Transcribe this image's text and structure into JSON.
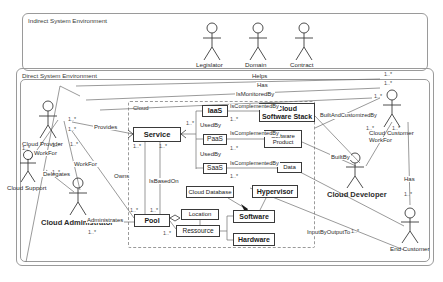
{
  "diagram": {
    "frames": [
      {
        "name": "indirect-system-environment",
        "label": "Indirect System Environment"
      },
      {
        "name": "direct-system-environment",
        "label": "Direct System Environment"
      },
      {
        "name": "cloud-boundary",
        "label": "Cloud"
      }
    ],
    "actors": [
      {
        "name": "legislator",
        "label": "Legislator",
        "x": 212,
        "y": 22,
        "bold": false
      },
      {
        "name": "domain",
        "label": "Domain",
        "x": 258,
        "y": 22,
        "bold": false
      },
      {
        "name": "contract",
        "label": "Contract",
        "x": 304,
        "y": 22,
        "bold": false
      },
      {
        "name": "cloud-provider",
        "label": "Cloud Provider",
        "x": 48,
        "y": 101,
        "bold": false
      },
      {
        "name": "cloud-support",
        "label": "Cloud Support",
        "x": 28,
        "y": 167,
        "bold": false
      },
      {
        "name": "cloud-administrator",
        "label": "Cloud Administrator",
        "x": 78,
        "y": 196,
        "bold": true
      },
      {
        "name": "cloud-customer",
        "label": "Cloud Customer",
        "x": 392,
        "y": 107,
        "bold": false
      },
      {
        "name": "cloud-developer",
        "label": "Cloud Developer",
        "x": 355,
        "y": 169,
        "bold": true
      },
      {
        "name": "end-customer",
        "label": "End Customer",
        "x": 410,
        "y": 228,
        "bold": false
      }
    ],
    "classes": [
      {
        "name": "service",
        "label": "Service",
        "x": 133,
        "y": 127,
        "w": 48,
        "h": 15,
        "bold": true,
        "size": 7.5
      },
      {
        "name": "iaas",
        "label": "IaaS",
        "x": 202,
        "y": 105,
        "w": 26,
        "h": 12,
        "bold": true,
        "size": 7
      },
      {
        "name": "paas",
        "label": "PaaS",
        "x": 203,
        "y": 134,
        "w": 24,
        "h": 11,
        "bold": false,
        "size": 6.5
      },
      {
        "name": "saas",
        "label": "SaaS",
        "x": 203,
        "y": 163,
        "w": 24,
        "h": 11,
        "bold": false,
        "size": 6.5
      },
      {
        "name": "cloud-software-stack",
        "label": "Cloud\nSoftware Stack",
        "x": 259,
        "y": 103,
        "w": 56,
        "h": 19,
        "bold": true,
        "size": 7
      },
      {
        "name": "software-product",
        "label": "Software\nProduct",
        "x": 264,
        "y": 130,
        "w": 38,
        "h": 18,
        "bold": false,
        "size": 6
      },
      {
        "name": "data",
        "label": "Data",
        "x": 277,
        "y": 162,
        "w": 25,
        "h": 11,
        "bold": false,
        "size": 6
      },
      {
        "name": "cloud-database",
        "label": "Cloud Database",
        "x": 186,
        "y": 186,
        "w": 48,
        "h": 12,
        "bold": false,
        "size": 6
      },
      {
        "name": "hypervisor",
        "label": "Hypervisor",
        "x": 252,
        "y": 185,
        "w": 46,
        "h": 13,
        "bold": true,
        "size": 7
      },
      {
        "name": "pool",
        "label": "Pool",
        "x": 134,
        "y": 214,
        "w": 36,
        "h": 13,
        "bold": true,
        "size": 7
      },
      {
        "name": "location",
        "label": "Location",
        "x": 181,
        "y": 209,
        "w": 38,
        "h": 11,
        "bold": false,
        "size": 6
      },
      {
        "name": "ressource",
        "label": "Ressource",
        "x": 176,
        "y": 225,
        "w": 44,
        "h": 12,
        "bold": false,
        "size": 6.5
      },
      {
        "name": "software",
        "label": "Software",
        "x": 233,
        "y": 210,
        "w": 42,
        "h": 13,
        "bold": true,
        "size": 7
      },
      {
        "name": "hardware",
        "label": "Hardware",
        "x": 233,
        "y": 233,
        "w": 42,
        "h": 13,
        "bold": true,
        "size": 7
      }
    ],
    "relations": [
      {
        "name": "rel-helps",
        "label": "Helps",
        "x": 251,
        "y": 73
      },
      {
        "name": "rel-has-top",
        "label": "Has",
        "x": 256,
        "y": 82
      },
      {
        "name": "rel-ismonitoredby",
        "label": "IsMonitoredBy",
        "x": 235,
        "y": 91
      },
      {
        "name": "rel-provides",
        "label": "Provides",
        "x": 93,
        "y": 128
      },
      {
        "name": "rel-owns",
        "label": "Owns",
        "x": 113,
        "y": 173
      },
      {
        "name": "rel-workfor-left-a",
        "label": "WorkFor",
        "x": 33,
        "y": 152
      },
      {
        "name": "rel-workfor-left-b",
        "label": "WorkFor",
        "x": 73,
        "y": 187
      },
      {
        "name": "rel-delegates",
        "label": "Delegates",
        "x": 42,
        "y": 176
      },
      {
        "name": "rel-administrates",
        "label": "Administrates",
        "x": 86,
        "y": 226
      },
      {
        "name": "rel-usedby-1",
        "label": "UsedBy",
        "x": 200,
        "y": 122
      },
      {
        "name": "rel-usedby-2",
        "label": "UsedBy",
        "x": 200,
        "y": 151
      },
      {
        "name": "rel-iscomplementedby-1",
        "label": "IsComplementedBy",
        "x": 229,
        "y": 104
      },
      {
        "name": "rel-iscomplementedby-2",
        "label": "IsComplementedBy",
        "x": 229,
        "y": 131
      },
      {
        "name": "rel-iscomplementedby-3",
        "label": "IsComplementedBy",
        "x": 229,
        "y": 162
      },
      {
        "name": "rel-isbasedon",
        "label": "IsBasedOn",
        "x": 148,
        "y": 178
      },
      {
        "name": "rel-buildandcustomizedby",
        "label": "BuiltAndCustomizedBy",
        "x": 321,
        "y": 113
      },
      {
        "name": "rel-builtby",
        "label": "BuiltBy",
        "x": 330,
        "y": 156
      },
      {
        "name": "rel-workfor-right",
        "label": "WorkFor",
        "x": 378,
        "y": 130
      },
      {
        "name": "rel-has-right",
        "label": "Has",
        "x": 406,
        "y": 178
      },
      {
        "name": "rel-inputbyoutputto",
        "label": "InputByOutputTo",
        "x": 318,
        "y": 230
      }
    ],
    "multiplicities": [
      {
        "name": "mult",
        "label": "1..*",
        "x": 384,
        "y": 72
      },
      {
        "name": "mult",
        "label": "1..*",
        "x": 384,
        "y": 81
      },
      {
        "name": "mult",
        "label": "1..*",
        "x": 374,
        "y": 94
      },
      {
        "name": "mult",
        "label": "1..*",
        "x": 68,
        "y": 117
      },
      {
        "name": "mult",
        "label": "1..*",
        "x": 68,
        "y": 127
      },
      {
        "name": "mult",
        "label": "1..*",
        "x": 70,
        "y": 142
      },
      {
        "name": "mult",
        "label": "1..*",
        "x": 22,
        "y": 146
      },
      {
        "name": "mult",
        "label": "1..*",
        "x": 52,
        "y": 143
      },
      {
        "name": "mult",
        "label": "1..*",
        "x": 52,
        "y": 170
      },
      {
        "name": "mult",
        "label": "1..*",
        "x": 88,
        "y": 230
      },
      {
        "name": "mult",
        "label": "1..*",
        "x": 133,
        "y": 144
      },
      {
        "name": "mult",
        "label": "1..*",
        "x": 159,
        "y": 144
      },
      {
        "name": "mult",
        "label": "1..*",
        "x": 186,
        "y": 121
      },
      {
        "name": "mult",
        "label": "1..*",
        "x": 230,
        "y": 117
      },
      {
        "name": "mult",
        "label": "1..*",
        "x": 230,
        "y": 146
      },
      {
        "name": "mult",
        "label": "1..*",
        "x": 230,
        "y": 174
      },
      {
        "name": "mult",
        "label": "1..*",
        "x": 130,
        "y": 208
      },
      {
        "name": "mult",
        "label": "1..*",
        "x": 150,
        "y": 208
      },
      {
        "name": "mult",
        "label": "1..*",
        "x": 163,
        "y": 231
      },
      {
        "name": "mult",
        "label": "1..*",
        "x": 366,
        "y": 126
      },
      {
        "name": "mult",
        "label": "1..*",
        "x": 392,
        "y": 126
      },
      {
        "name": "mult",
        "label": "1..*",
        "x": 404,
        "y": 192
      },
      {
        "name": "mult",
        "label": "1..*",
        "x": 351,
        "y": 229
      }
    ],
    "colors": {
      "stroke": "#3a3a3a",
      "frame": "#9a9a9a",
      "text": "#1a1a1a",
      "background": "#ffffff"
    }
  }
}
